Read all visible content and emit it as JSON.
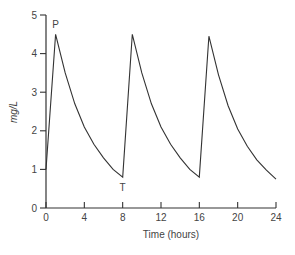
{
  "chart_data": {
    "type": "line",
    "title": "",
    "xlabel": "Time (hours)",
    "ylabel": "mg/L",
    "xlim": [
      0,
      24
    ],
    "ylim": [
      0,
      5
    ],
    "grid": false,
    "legend": null,
    "x_ticks": [
      0,
      4,
      8,
      12,
      16,
      20,
      24
    ],
    "y_ticks": [
      0,
      1,
      2,
      3,
      4,
      5
    ],
    "series": [
      {
        "name": "plasma concentration",
        "color": "#333333",
        "points": [
          [
            0,
            1.0
          ],
          [
            1,
            4.5
          ],
          [
            2,
            3.5
          ],
          [
            3,
            2.7
          ],
          [
            4,
            2.1
          ],
          [
            5,
            1.65
          ],
          [
            6,
            1.3
          ],
          [
            7,
            1.0
          ],
          [
            8,
            0.8
          ],
          [
            9,
            4.5
          ],
          [
            10,
            3.5
          ],
          [
            11,
            2.7
          ],
          [
            12,
            2.1
          ],
          [
            13,
            1.65
          ],
          [
            14,
            1.3
          ],
          [
            15,
            1.0
          ],
          [
            16,
            0.8
          ],
          [
            17,
            4.45
          ],
          [
            18,
            3.45
          ],
          [
            19,
            2.65
          ],
          [
            20,
            2.05
          ],
          [
            21,
            1.6
          ],
          [
            22,
            1.25
          ],
          [
            23,
            0.98
          ],
          [
            24,
            0.75
          ]
        ]
      }
    ],
    "annotations": [
      {
        "text": "P",
        "x": 1,
        "y": 4.5,
        "position": "above"
      },
      {
        "text": "T",
        "x": 8,
        "y": 0.8,
        "position": "below"
      }
    ]
  }
}
